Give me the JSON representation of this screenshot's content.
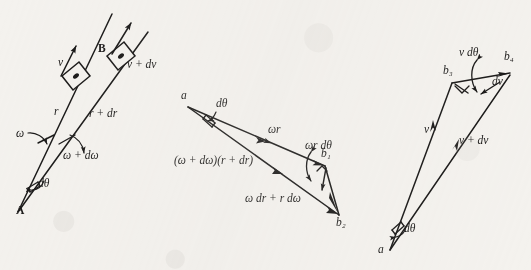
{
  "figure": {
    "title": "",
    "background_color": "#f4f2ee",
    "ink_color": "#111010",
    "panels": [
      {
        "id": "panel-left",
        "name": "rod-rotation-diagram",
        "description": "Rigid body B sliding outward on a rotating radial line from pivot A",
        "labels": [
          {
            "key": "point_a",
            "text": "A",
            "style": "bold",
            "x": 16,
            "y": 213
          },
          {
            "key": "point_b",
            "text": "B",
            "style": "bold",
            "x": 98,
            "y": 50
          },
          {
            "key": "v",
            "text": "v",
            "style": "italic",
            "x": 58,
            "y": 64
          },
          {
            "key": "v_plus_dv",
            "text": "v + dv",
            "style": "italic",
            "x": 127,
            "y": 66
          },
          {
            "key": "r",
            "text": "r",
            "style": "italic",
            "x": 54,
            "y": 113
          },
          {
            "key": "r_plus_dr",
            "text": "r + dr",
            "style": "italic",
            "x": 89,
            "y": 115
          },
          {
            "key": "omega",
            "text": "ω",
            "style": "italic",
            "x": 16,
            "y": 135
          },
          {
            "key": "omega_plus_domega",
            "text": "ω + dω",
            "style": "italic",
            "x": 63,
            "y": 157
          },
          {
            "key": "dtheta",
            "text": "dθ",
            "style": "italic",
            "x": 38,
            "y": 185
          }
        ]
      },
      {
        "id": "panel-middle",
        "name": "velocity-triangle-diagram",
        "description": "Velocity vector triangle a-b1-b2 showing omega*r and the increment components",
        "labels": [
          {
            "key": "point_a",
            "text": "a",
            "style": "italic",
            "x": 181,
            "y": 97
          },
          {
            "key": "dtheta",
            "text": "dθ",
            "style": "italic",
            "x": 216,
            "y": 105
          },
          {
            "key": "omega_r",
            "text": "ωr",
            "style": "italic",
            "x": 268,
            "y": 131
          },
          {
            "key": "omega_r_dtheta",
            "text": "ωr dθ",
            "style": "italic",
            "x": 305,
            "y": 147
          },
          {
            "key": "point_b1",
            "text": "b₁",
            "style": "italic",
            "x": 321,
            "y": 155
          },
          {
            "key": "long_side",
            "text": "(ω + dω)(r + dr)",
            "style": "italic",
            "x": 174,
            "y": 162
          },
          {
            "key": "omega_dr_r_domega",
            "text": "ω dr + r dω",
            "style": "italic",
            "x": 245,
            "y": 200
          },
          {
            "key": "point_b2",
            "text": "b₂",
            "style": "italic",
            "x": 336,
            "y": 224
          }
        ]
      },
      {
        "id": "panel-right",
        "name": "speed-triangle-diagram",
        "description": "Velocity increment triangle a-b3-b4 showing v, v+dv, v dtheta and dv",
        "labels": [
          {
            "key": "v_dtheta",
            "text": "v dθ",
            "style": "italic",
            "x": 459,
            "y": 54
          },
          {
            "key": "point_b4",
            "text": "b₄",
            "style": "italic",
            "x": 504,
            "y": 58
          },
          {
            "key": "point_b3",
            "text": "b₃",
            "style": "italic",
            "x": 443,
            "y": 72
          },
          {
            "key": "dv",
            "text": "dv",
            "style": "italic",
            "x": 492,
            "y": 83
          },
          {
            "key": "v",
            "text": "v",
            "style": "italic",
            "x": 424,
            "y": 131
          },
          {
            "key": "v_plus_dv",
            "text": "v + dv",
            "style": "italic",
            "x": 459,
            "y": 142
          },
          {
            "key": "dtheta",
            "text": "dθ",
            "style": "italic",
            "x": 404,
            "y": 230
          },
          {
            "key": "point_a",
            "text": "a",
            "style": "italic",
            "x": 378,
            "y": 251
          }
        ]
      }
    ]
  }
}
